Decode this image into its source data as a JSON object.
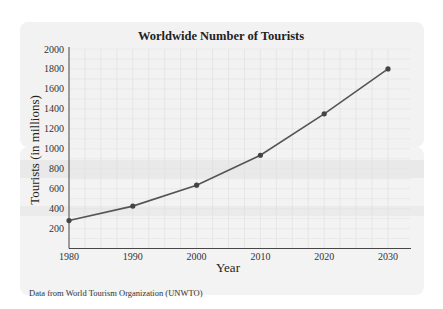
{
  "chart_data": {
    "type": "line",
    "title": "Worldwide Number of Tourists",
    "xlabel": "Year",
    "ylabel": "Tourists (in millions)",
    "x": [
      1980,
      1990,
      2000,
      2010,
      2020,
      2030
    ],
    "series": [
      {
        "name": "Tourists",
        "values": [
          280,
          425,
          635,
          935,
          1350,
          1800
        ]
      }
    ],
    "xticks": [
      "1980",
      "1990",
      "2000",
      "2010",
      "2020",
      "2030"
    ],
    "yticks": [
      "200",
      "400",
      "600",
      "800",
      "1000",
      "1200",
      "1400",
      "1600",
      "1800",
      "2000"
    ],
    "ylim": [
      0,
      2000
    ],
    "xlim": [
      1980,
      2033
    ],
    "grid": true,
    "legend": null,
    "line_color": "#555555"
  },
  "source_note": "Data from World Tourism Organization (UNWTO)"
}
